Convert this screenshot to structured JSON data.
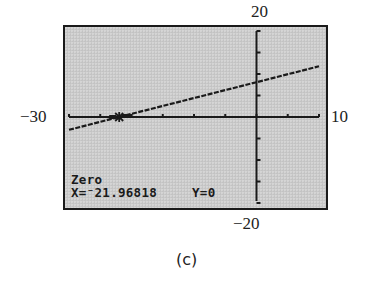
{
  "figure": {
    "caption": "(c)"
  },
  "window_labels": {
    "ymax": "20",
    "ymin": "−20",
    "xmin": "−30",
    "xmax": "10"
  },
  "screen": {
    "mode_label": "Zero",
    "x_readout": "X=⁻21.96818",
    "y_readout": "Y=0",
    "colors": {
      "lcd_background": "#c9c9c9",
      "ink": "#1a1a1a",
      "frame": "#1a1a1a"
    }
  },
  "chart_data": {
    "type": "line",
    "title": "",
    "xlabel": "",
    "ylabel": "",
    "xlim": [
      -30,
      10
    ],
    "ylim": [
      -20,
      20
    ],
    "xscale_ticks": 5,
    "yscale_ticks": 5,
    "grid": false,
    "series": [
      {
        "name": "y = f(x)",
        "x": [
          -30,
          -21.96818,
          0,
          10
        ],
        "y": [
          -2.97,
          0,
          8.1,
          11.8
        ]
      }
    ],
    "annotations": [
      {
        "type": "zero-cursor",
        "x": -21.96818,
        "y": 0,
        "text": "Zero  X=-21.96818  Y=0"
      }
    ],
    "tick_labels": {
      "x": [
        "-30",
        "10"
      ],
      "y": [
        "-20",
        "20"
      ]
    }
  }
}
